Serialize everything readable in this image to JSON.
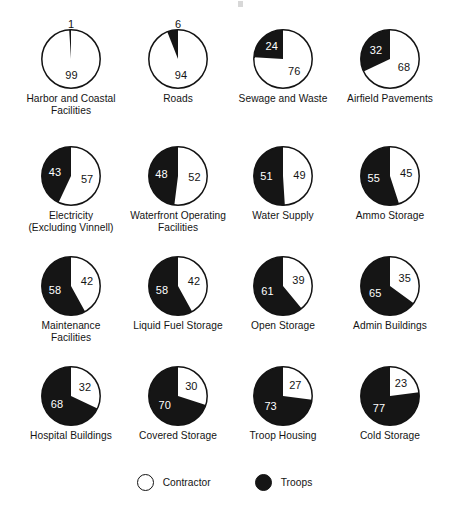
{
  "chart_data": {
    "type": "pie",
    "title": "",
    "legend": {
      "position": "bottom",
      "entries": [
        {
          "name": "Contractor",
          "color": "#ffffff"
        },
        {
          "name": "Troops",
          "color": "#151515"
        }
      ]
    },
    "series": [
      {
        "name": "Contractor",
        "color": "#ffffff"
      },
      {
        "name": "Troops",
        "color": "#151515"
      }
    ],
    "units": "percent",
    "panels": [
      {
        "label": "Harbor and Coastal Facilities",
        "label_lines": [
          "Harbor and Coastal",
          "Facilities"
        ],
        "troops": 1,
        "contractor": 99
      },
      {
        "label": "Roads",
        "label_lines": [
          "Roads"
        ],
        "troops": 6,
        "contractor": 94
      },
      {
        "label": "Sewage and Waste",
        "label_lines": [
          "Sewage and Waste"
        ],
        "troops": 24,
        "contractor": 76
      },
      {
        "label": "Airfield Pavements",
        "label_lines": [
          "Airfield Pavements"
        ],
        "troops": 32,
        "contractor": 68
      },
      {
        "label": "Electricity (Excluding Vinnell)",
        "label_lines": [
          "Electricity",
          "(Excluding Vinnell)"
        ],
        "troops": 43,
        "contractor": 57
      },
      {
        "label": "Waterfront Operating Facilities",
        "label_lines": [
          "Waterfront Operating",
          "Facilities"
        ],
        "troops": 48,
        "contractor": 52
      },
      {
        "label": "Water Supply",
        "label_lines": [
          "Water Supply"
        ],
        "troops": 51,
        "contractor": 49
      },
      {
        "label": "Ammo Storage",
        "label_lines": [
          "Ammo Storage"
        ],
        "troops": 55,
        "contractor": 45
      },
      {
        "label": "Maintenance Facilities",
        "label_lines": [
          "Maintenance",
          "Facilities"
        ],
        "troops": 58,
        "contractor": 42
      },
      {
        "label": "Liquid Fuel Storage",
        "label_lines": [
          "Liquid Fuel Storage"
        ],
        "troops": 58,
        "contractor": 42
      },
      {
        "label": "Open Storage",
        "label_lines": [
          "Open Storage"
        ],
        "troops": 61,
        "contractor": 39
      },
      {
        "label": "Admin Buildings",
        "label_lines": [
          "Admin Buildings"
        ],
        "troops": 65,
        "contractor": 35
      },
      {
        "label": "Hospital Buildings",
        "label_lines": [
          "Hospital Buildings"
        ],
        "troops": 68,
        "contractor": 32
      },
      {
        "label": "Covered Storage",
        "label_lines": [
          "Covered Storage"
        ],
        "troops": 70,
        "contractor": 30
      },
      {
        "label": "Troop Housing",
        "label_lines": [
          "Troop Housing"
        ],
        "troops": 73,
        "contractor": 27
      },
      {
        "label": "Cold Storage",
        "label_lines": [
          "Cold Storage"
        ],
        "troops": 77,
        "contractor": 23
      }
    ]
  },
  "colors": {
    "troops": "#151515",
    "contractor": "#ffffff",
    "outline": "#131313",
    "text": "#141414",
    "text_inverse": "#ffffff"
  },
  "legend": {
    "contractor_label": "Contractor",
    "troops_label": "Troops"
  }
}
